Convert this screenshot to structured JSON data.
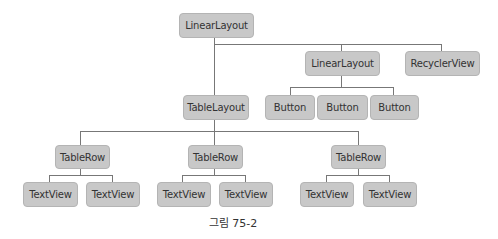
{
  "diagram": {
    "type": "tree",
    "caption": "그림 75-2",
    "nodes": {
      "root": "LinearLayout",
      "linear_child": "LinearLayout",
      "recycler": "RecyclerView",
      "button_1": "Button",
      "button_2": "Button",
      "button_3": "Button",
      "table_layout": "TableLayout",
      "table_row_1": "TableRow",
      "table_row_2": "TableRow",
      "table_row_3": "TableRow",
      "text_view_1": "TextView",
      "text_view_2": "TextView",
      "text_view_3": "TextView",
      "text_view_4": "TextView",
      "text_view_5": "TextView",
      "text_view_6": "TextView"
    },
    "edges": [
      [
        "root",
        "table_layout"
      ],
      [
        "root",
        "linear_child"
      ],
      [
        "root",
        "recycler"
      ],
      [
        "linear_child",
        "button_1"
      ],
      [
        "linear_child",
        "button_2"
      ],
      [
        "linear_child",
        "button_3"
      ],
      [
        "table_layout",
        "table_row_1"
      ],
      [
        "table_layout",
        "table_row_2"
      ],
      [
        "table_layout",
        "table_row_3"
      ],
      [
        "table_row_1",
        "text_view_1"
      ],
      [
        "table_row_1",
        "text_view_2"
      ],
      [
        "table_row_2",
        "text_view_3"
      ],
      [
        "table_row_2",
        "text_view_4"
      ],
      [
        "table_row_3",
        "text_view_5"
      ],
      [
        "table_row_3",
        "text_view_6"
      ]
    ],
    "colors": {
      "node_fill": "#c8c8c8",
      "node_border": "#b4b4b4",
      "connector": "#777777",
      "text": "#333333"
    }
  }
}
